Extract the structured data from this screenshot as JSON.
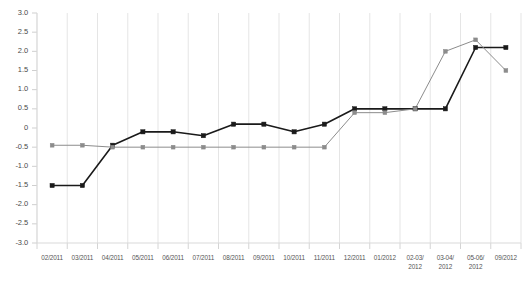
{
  "chart_data": {
    "type": "line",
    "title": "",
    "subtitle": "",
    "xlabel": "",
    "ylabel": "",
    "ylim": [
      -3.0,
      3.0
    ],
    "ytick_step": 0.5,
    "grid": "vertical",
    "legend": "none",
    "categories": [
      "02/2011",
      "03/2011",
      "04/2011",
      "05/2011",
      "06/2011",
      "07/2011",
      "08/2011",
      "09/2011",
      "10/2011",
      "11/2011",
      "12/2011",
      "01/2012",
      "02-03/\n2012",
      "03-04/\n2012",
      "05-06/\n2012",
      "09/2012"
    ],
    "ytick_labels": [
      "3.0",
      "2.5",
      "2.0",
      "1.5",
      "1.0",
      "0.5",
      "0",
      "-0.5",
      "-1.0",
      "-1.5",
      "-2.0",
      "-2.5",
      "-3.0"
    ],
    "ytick_values": [
      3.0,
      2.5,
      2.0,
      1.5,
      1.0,
      0.5,
      0,
      -0.5,
      -1.0,
      -1.5,
      -2.0,
      -2.5,
      -3.0
    ],
    "series": [
      {
        "name": "series-dark",
        "color": "#1a1a1a",
        "marker": "square",
        "values": [
          -1.5,
          -1.5,
          -0.45,
          -0.1,
          -0.1,
          -0.2,
          0.1,
          0.1,
          -0.1,
          0.1,
          0.5,
          0.5,
          0.5,
          0.5,
          2.1,
          2.1
        ]
      },
      {
        "name": "series-gray",
        "color": "#8c8c8c",
        "marker": "square",
        "values": [
          -0.45,
          -0.45,
          -0.5,
          -0.5,
          -0.5,
          -0.5,
          -0.5,
          -0.5,
          -0.5,
          -0.5,
          0.4,
          0.4,
          0.5,
          2.0,
          2.3,
          1.5
        ]
      }
    ]
  },
  "axis_style": {
    "gridline_color": "#e2e2e2",
    "axis_color": "#d9d9d9",
    "tick_color": "#cfcfcf"
  }
}
